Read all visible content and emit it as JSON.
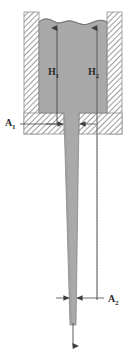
{
  "figure": {
    "type": "physics-schematic",
    "background_color": "#ffffff"
  },
  "labels": {
    "h1": {
      "base": "H",
      "sub": "1",
      "x": 48,
      "y": 72,
      "meaning": "height-of-liquid-column-1"
    },
    "h2": {
      "base": "H",
      "sub": "2",
      "x": 88,
      "y": 72,
      "meaning": "height-of-liquid-column-2"
    },
    "a1": {
      "base": "A",
      "sub": "1",
      "x": 6,
      "y": 125,
      "meaning": "cross-sectional-area-at-vessel-outlet"
    },
    "a2": {
      "base": "A",
      "sub": "2",
      "x": 106,
      "y": 303,
      "meaning": "cross-sectional-area-at-tube-exit"
    }
  },
  "colors": {
    "liquid_fill": "#a9a9a9",
    "wall_hatch_line": "#9a9a9a",
    "wall_outline": "#8a8a8a",
    "liquid_outline": "#777777",
    "arrow_line": "#4a4a4a",
    "label_text": "#2a2a2a",
    "dotted_guide": "#bdbdbd"
  },
  "geometry": {
    "vessel": {
      "outer_left": 24,
      "outer_right": 122,
      "outer_top": 12,
      "outer_bottom": 134,
      "wall_thickness": 15,
      "inner_left": 39,
      "inner_right": 107,
      "inner_bottom": 113
    },
    "liquid_surface_y": 22,
    "liquid_surface_wavy": true,
    "tube": {
      "top_y": 113,
      "top_left": 64,
      "top_right": 79,
      "bottom_y": 325,
      "bottom_left": 70,
      "bottom_right": 76,
      "tapered": true
    },
    "h1_arrow": {
      "x": 57,
      "y_bottom": 124,
      "y_top": 24
    },
    "h2_arrow": {
      "x": 97,
      "y_bottom": 300,
      "y_top": 24
    },
    "a1_markers": {
      "y": 124,
      "left_tip": 64,
      "right_tip": 79
    },
    "a2_markers": {
      "y": 298,
      "left_tip": 70,
      "right_tip": 76
    },
    "exit_arrow": {
      "x": 73,
      "y_top": 325,
      "y_bottom": 350
    }
  },
  "annotations": {
    "h1_description": "upward arrow from vessel base to liquid surface at left reference line",
    "h2_description": "upward arrow from tube exit level to liquid surface at right reference line",
    "a1_description": "horizontal leader line with inward-pointing arrowheads marking wide tube cross-section",
    "a2_description": "horizontal leader line with inward-pointing arrowheads marking narrow tube exit cross-section"
  }
}
